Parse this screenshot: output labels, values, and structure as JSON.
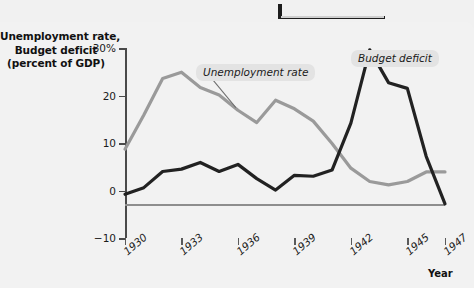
{
  "figure": {
    "y_axis_title_lines": [
      "Unemployment rate,",
      "Budget deficit",
      "(percent of GDP)"
    ],
    "x_axis_title": "Year",
    "callouts": {
      "unemployment": "Unemployment rate",
      "budget": "Budget deficit"
    },
    "colors": {
      "unemployment_line": "#9a9a9a",
      "budget_line": "#222222",
      "zero_line": "#8e8e8e",
      "axis": "#4a4a4a",
      "callout_background": "#e3e3e3",
      "page_background": "#f2f2f2",
      "plot_background": "#ffffff",
      "top_rule": "#1d1d1d"
    }
  },
  "chart_data": {
    "type": "line",
    "title": "",
    "xlabel": "Year",
    "ylabel": "Unemployment rate, Budget deficit (percent of GDP)",
    "xlim": [
      1930,
      1947
    ],
    "ylim": [
      -10,
      30
    ],
    "ytick_labels": [
      "30%",
      "20",
      "10",
      "0",
      "-10"
    ],
    "ytick_values": [
      30,
      20,
      10,
      0,
      -10
    ],
    "xtick_labels": [
      "1930",
      "1933",
      "1936",
      "1939",
      "1942",
      "1945",
      "1947"
    ],
    "xtick_values": [
      1930,
      1933,
      1936,
      1939,
      1942,
      1945,
      1947
    ],
    "grid": false,
    "legend": "annotations",
    "x": [
      1930,
      1931,
      1932,
      1933,
      1934,
      1935,
      1936,
      1937,
      1938,
      1939,
      1940,
      1941,
      1942,
      1943,
      1944,
      1945,
      1946,
      1947
    ],
    "series": [
      {
        "name": "Unemployment rate",
        "color": "#9a9a9a",
        "values": [
          8.7,
          15.9,
          23.6,
          24.9,
          21.7,
          20.1,
          16.9,
          14.3,
          19.0,
          17.2,
          14.6,
          9.9,
          4.7,
          1.9,
          1.2,
          1.9,
          3.9,
          3.9
        ]
      },
      {
        "name": "Budget deficit",
        "color": "#222222",
        "values": [
          -0.8,
          0.6,
          4.0,
          4.5,
          5.9,
          4.0,
          5.5,
          2.5,
          0.1,
          3.2,
          3.0,
          4.3,
          14.2,
          29.6,
          22.7,
          21.5,
          7.2,
          -2.8
        ]
      }
    ]
  }
}
